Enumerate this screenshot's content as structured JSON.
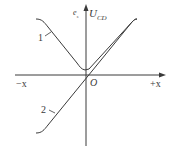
{
  "diagram": {
    "type": "characteristic-curve",
    "axes": {
      "x_negative_label": "−x",
      "x_positive_label": "+x",
      "origin_label": "O",
      "y_label_left": "e",
      "y_label_left_sub": "s",
      "y_label_right": "U",
      "y_label_right_sub": "CD"
    },
    "curves": [
      {
        "id": "1",
        "label": "1",
        "shape": "V-shaped output with minimum near origin (phase-insensitive)"
      },
      {
        "id": "2",
        "label": "2",
        "shape": "linear through origin with saturation at ends (phase-sensitive)"
      }
    ],
    "colors": {
      "line": "#3a3a3a",
      "background": "#ffffff"
    }
  }
}
